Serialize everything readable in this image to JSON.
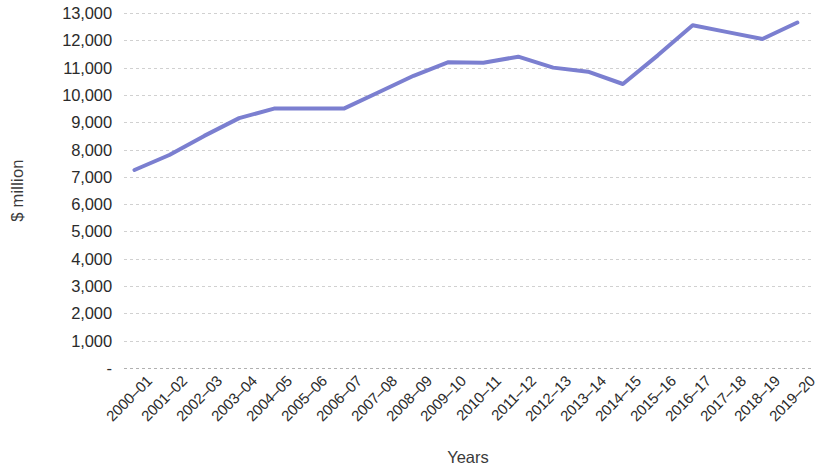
{
  "chart_data": {
    "type": "line",
    "title": "",
    "xlabel": "Years",
    "ylabel": "$ million",
    "categories": [
      "2000–01",
      "2001–02",
      "2002–03",
      "2003–04",
      "2004–05",
      "2005–06",
      "2006–07",
      "2007–08",
      "2008–09",
      "2009–10",
      "2010–11",
      "2011–12",
      "2012–13",
      "2013–14",
      "2014–15",
      "2015–16",
      "2016–17",
      "2017–18",
      "2018–19",
      "2019–20"
    ],
    "values": [
      7250,
      7800,
      8500,
      9150,
      9500,
      9500,
      9500,
      10100,
      10700,
      11200,
      11180,
      11400,
      11000,
      10850,
      10400,
      11450,
      12550,
      12300,
      12050,
      12650
    ],
    "ylim": [
      0,
      13000
    ],
    "y_ticks": [
      0,
      1000,
      2000,
      3000,
      4000,
      5000,
      6000,
      7000,
      8000,
      9000,
      10000,
      11000,
      12000,
      13000
    ],
    "y_tick_labels": [
      "-",
      "1,000",
      "2,000",
      "3,000",
      "4,000",
      "5,000",
      "6,000",
      "7,000",
      "8,000",
      "9,000",
      "10,000",
      "11,000",
      "12,000",
      "13,000"
    ],
    "grid": true,
    "grid_axis": "y",
    "legend": false,
    "legend_position": "none",
    "series_color": "#7b7fd0",
    "series_width": 4,
    "background_color": "#ffffff",
    "grid_color": "#aaaaaa",
    "text_color": "#2b2b2b"
  }
}
